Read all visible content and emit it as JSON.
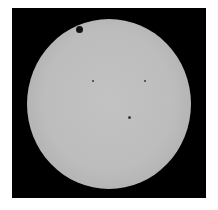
{
  "image": {
    "subject": "transit of Venus across the Sun",
    "background_color": "#000000",
    "disk_color": "#bdbdbd",
    "features": [
      {
        "name": "venus-silhouette",
        "x": 80,
        "y": 30,
        "r": 3.5
      },
      {
        "name": "sunspot",
        "x": 93,
        "y": 81,
        "r": 1
      },
      {
        "name": "sunspot",
        "x": 145,
        "y": 81,
        "r": 1
      },
      {
        "name": "sunspot",
        "x": 129,
        "y": 117,
        "r": 1.2
      }
    ]
  }
}
